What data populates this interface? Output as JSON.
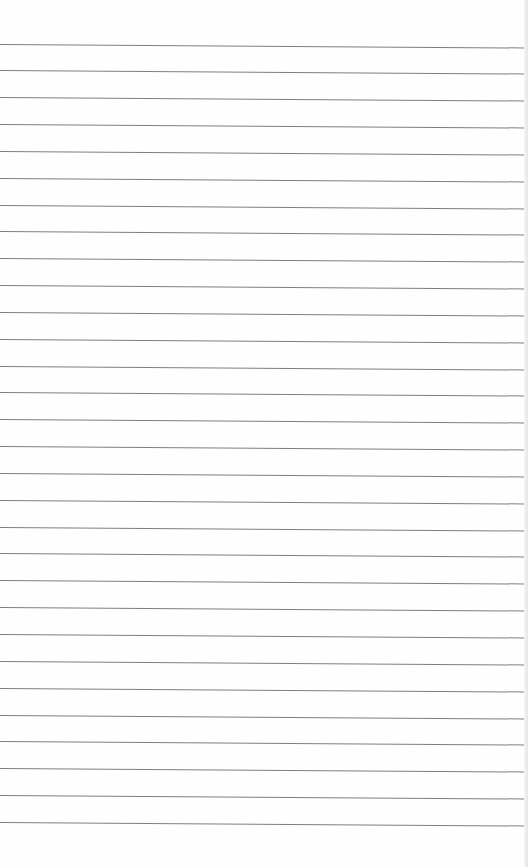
{
  "page": {
    "type": "lined-paper",
    "background_color": "#fefefe",
    "rule_color": "#707070",
    "rule_count": 30,
    "first_rule_y": 43.5,
    "rule_spacing": 26.84,
    "text_content": []
  }
}
